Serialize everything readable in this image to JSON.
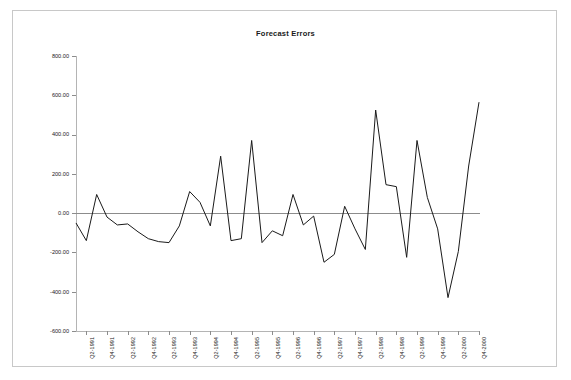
{
  "chart_data": {
    "type": "line",
    "title": "Forecast Errors",
    "xlabel": "",
    "ylabel": "",
    "ylim": [
      -600,
      800
    ],
    "ytick_values": [
      800,
      600,
      400,
      200,
      0,
      -200,
      -400,
      -600
    ],
    "ytick_labels": [
      "800.00",
      "600.00",
      "400.00",
      "200.00",
      "0.00",
      "-200.00",
      "-400.00",
      "-600.00"
    ],
    "grid": false,
    "legend": "none",
    "zero_line": true,
    "line_color": "#1a1a1a",
    "x": [
      "Q1-1991",
      "Q2-1991",
      "Q3-1991",
      "Q4-1991",
      "Q1-1992",
      "Q2-1992",
      "Q3-1992",
      "Q4-1992",
      "Q1-1993",
      "Q2-1993",
      "Q3-1993",
      "Q4-1993",
      "Q1-1994",
      "Q2-1994",
      "Q3-1994",
      "Q4-1994",
      "Q1-1995",
      "Q2-1995",
      "Q3-1995",
      "Q4-1995",
      "Q1-1996",
      "Q2-1996",
      "Q3-1996",
      "Q4-1996",
      "Q1-1997",
      "Q2-1997",
      "Q3-1997",
      "Q4-1997",
      "Q1-1998",
      "Q2-1998",
      "Q3-1998",
      "Q4-1998",
      "Q1-1999",
      "Q2-1999",
      "Q3-1999",
      "Q4-1999",
      "Q1-2000",
      "Q2-2000",
      "Q3-2000",
      "Q4-2000"
    ],
    "xtick_labels": [
      "Q2-1991",
      "Q4-1991",
      "Q2-1992",
      "Q4-1992",
      "Q2-1993",
      "Q4-1993",
      "Q2-1994",
      "Q4-1994",
      "Q2-1995",
      "Q4-1995",
      "Q2-1996",
      "Q4-1996",
      "Q2-1997",
      "Q4-1997",
      "Q2-1998",
      "Q4-1998",
      "Q2-1999",
      "Q4-1999",
      "Q2-2000",
      "Q4-2000"
    ],
    "xtick_indices": [
      1,
      3,
      5,
      7,
      9,
      11,
      13,
      15,
      17,
      19,
      21,
      23,
      25,
      27,
      29,
      31,
      33,
      35,
      37,
      39
    ],
    "values": [
      -50,
      -140,
      95,
      -20,
      -60,
      -55,
      -95,
      -130,
      -145,
      -150,
      -65,
      110,
      55,
      -65,
      290,
      -140,
      -130,
      370,
      -150,
      -90,
      -115,
      95,
      -60,
      -15,
      -250,
      -210,
      35,
      -80,
      -185,
      525,
      145,
      135,
      -225,
      370,
      80,
      -80,
      -430,
      -195,
      240,
      565
    ],
    "series": [
      {
        "name": "Forecast Errors",
        "values": [
          -50,
          -140,
          95,
          -20,
          -60,
          -55,
          -95,
          -130,
          -145,
          -150,
          -65,
          110,
          55,
          -65,
          290,
          -140,
          -130,
          370,
          -150,
          -90,
          -115,
          95,
          -60,
          -15,
          -250,
          -210,
          35,
          -80,
          -185,
          525,
          145,
          135,
          -225,
          370,
          80,
          -80,
          -430,
          -195,
          240,
          565
        ]
      }
    ]
  },
  "frame": {
    "border_color": "#c8c8c8"
  }
}
